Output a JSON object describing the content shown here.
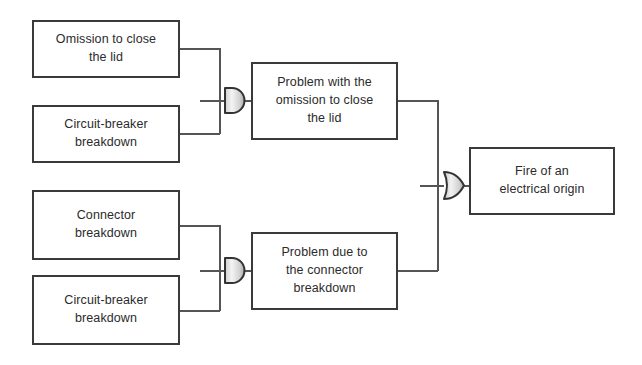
{
  "diagram": {
    "type": "fault-tree",
    "colors": {
      "box_border": "#3a3a3a",
      "wire": "#555555",
      "gate_outline": "#333333",
      "gate_fill_light": "#f2f2f2",
      "gate_fill_dark": "#b9b9b9",
      "background": "#ffffff",
      "text": "#2b2b2b"
    },
    "basic_events": [
      {
        "id": "omission-to-close-the-lid",
        "label": "Omission to close\nthe lid"
      },
      {
        "id": "circuit-breaker-breakdown-top",
        "label": "Circuit-breaker\nbreakdown"
      },
      {
        "id": "connector-breakdown",
        "label": "Connector\nbreakdown"
      },
      {
        "id": "circuit-breaker-breakdown-bottom",
        "label": "Circuit-breaker\nbreakdown"
      }
    ],
    "intermediate_events": [
      {
        "id": "problem-with-omission-to-close-the-lid",
        "label": "Problem with the\nomission to close\nthe lid"
      },
      {
        "id": "problem-due-to-connector-breakdown",
        "label": "Problem due to\nthe connector\nbreakdown"
      }
    ],
    "top_event": {
      "id": "fire-of-an-electrical-origin",
      "label": "Fire of an\nelectrical origin"
    },
    "gates": [
      {
        "id": "and-gate-upper",
        "kind": "AND",
        "inputs": [
          "omission-to-close-the-lid",
          "circuit-breaker-breakdown-top"
        ],
        "output": "problem-with-omission-to-close-the-lid"
      },
      {
        "id": "and-gate-lower",
        "kind": "AND",
        "inputs": [
          "connector-breakdown",
          "circuit-breaker-breakdown-bottom"
        ],
        "output": "problem-due-to-connector-breakdown"
      },
      {
        "id": "or-gate-top",
        "kind": "OR",
        "inputs": [
          "problem-with-omission-to-close-the-lid",
          "problem-due-to-connector-breakdown"
        ],
        "output": "fire-of-an-electrical-origin"
      }
    ]
  }
}
